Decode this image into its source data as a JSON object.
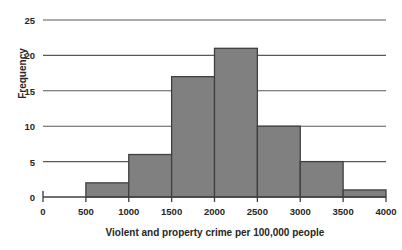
{
  "chart_data": {
    "type": "bar",
    "title": "",
    "subtitle": "",
    "xlabel": "Violent and property crime per 100,000 people",
    "ylabel": "Frequency",
    "xlim": [
      0,
      4000
    ],
    "ylim": [
      0,
      25
    ],
    "grid": "horizontal",
    "legend": "none",
    "bar_color": "#808080",
    "bar_edge_color": "#404040",
    "axis_color": "#404040",
    "grid_color": "#595959",
    "text_color": "#262626",
    "background_color": "#ffffff",
    "x_ticks": [
      0,
      500,
      1000,
      1500,
      2000,
      2500,
      3000,
      3500,
      4000
    ],
    "x_tick_labels": [
      "0",
      "500",
      "1000",
      "1500",
      "2000",
      "2500",
      "3000",
      "3500",
      "4000"
    ],
    "y_ticks": [
      0,
      5,
      10,
      15,
      20,
      25
    ],
    "y_tick_labels": [
      "0",
      "5",
      "10",
      "15",
      "20",
      "25"
    ],
    "bin_width": 500,
    "categories": [
      "0-500",
      "500-1000",
      "1000-1500",
      "1500-2000",
      "2000-2500",
      "2500-3000",
      "3000-3500",
      "3500-4000"
    ],
    "bins": [
      {
        "start": 0,
        "end": 500,
        "value": 0
      },
      {
        "start": 500,
        "end": 1000,
        "value": 2
      },
      {
        "start": 1000,
        "end": 1500,
        "value": 6
      },
      {
        "start": 1500,
        "end": 2000,
        "value": 17
      },
      {
        "start": 2000,
        "end": 2500,
        "value": 21
      },
      {
        "start": 2500,
        "end": 3000,
        "value": 10
      },
      {
        "start": 3000,
        "end": 3500,
        "value": 5
      },
      {
        "start": 3500,
        "end": 4000,
        "value": 1
      }
    ],
    "values": [
      0,
      2,
      6,
      17,
      21,
      10,
      5,
      1
    ]
  }
}
